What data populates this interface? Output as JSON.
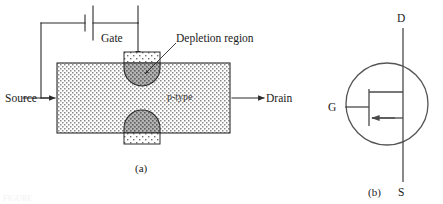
{
  "figure": {
    "background_color": "#ffffff",
    "ink_color": "#1a1a1a",
    "faint_caption_fragment": "FIGURE"
  },
  "panel_a": {
    "caption": "(a)",
    "labels": {
      "source": "Source",
      "drain": "Drain",
      "gate": "Gate",
      "channel": "p-type",
      "depletion": "Depletion region"
    },
    "components": {
      "battery_name": "battery-symbol",
      "bar_name": "p-type-channel-bar",
      "gate_top_name": "gate-region-top",
      "gate_bottom_name": "gate-region-bottom",
      "depletion_top_name": "depletion-region-top",
      "depletion_bottom_name": "depletion-region-bottom"
    },
    "colors": {
      "channel_fill": "#d9d9d9",
      "gate_fill": "#f0f0f0",
      "depletion_fill": "#9a9a9a",
      "outline": "#2b2b2b"
    }
  },
  "panel_b": {
    "caption": "(b)",
    "labels": {
      "drain": "D",
      "gate": "G",
      "source": "S"
    },
    "symbol_type": "p-channel JFET",
    "colors": {
      "symbol_stroke": "#4a4a4a",
      "circle_stroke": "#555555"
    }
  }
}
